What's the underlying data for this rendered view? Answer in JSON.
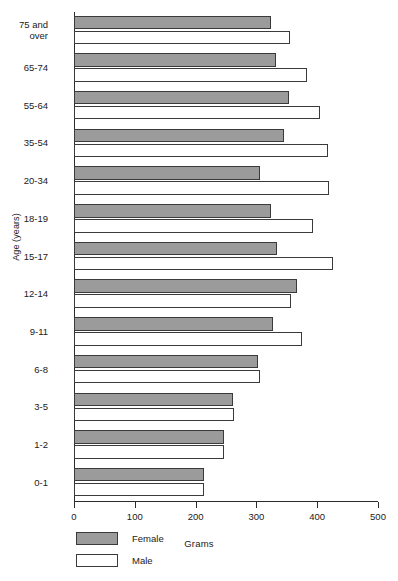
{
  "chart_data": {
    "type": "bar",
    "orientation": "horizontal",
    "title": "",
    "xlabel": "Grams",
    "ylabel": "Age (years)",
    "xlim": [
      0,
      500
    ],
    "xticks": [
      0,
      100,
      200,
      300,
      400,
      500
    ],
    "xtick_labels": [
      "0",
      "100",
      "200",
      "300",
      "400",
      "500"
    ],
    "grid": false,
    "legend_position": "bottom-left",
    "categories": [
      "75 and\nover",
      "65-74",
      "55-64",
      "35-54",
      "20-34",
      "18-19",
      "15-17",
      "12-14",
      "9-11",
      "6-8",
      "3-5",
      "1-2",
      "0-1"
    ],
    "series": [
      {
        "name": "Female",
        "color": "#9b9b9b",
        "values": [
          324,
          332,
          354,
          345,
          306,
          324,
          334,
          367,
          327,
          303,
          262,
          247,
          214
        ]
      },
      {
        "name": "Male",
        "color": "#ffffff",
        "values": [
          355,
          383,
          405,
          418,
          419,
          393,
          426,
          357,
          375,
          306,
          263,
          247,
          214
        ]
      }
    ]
  },
  "legend": {
    "items": [
      {
        "label": "Female",
        "swatch": "female"
      },
      {
        "label": "Male",
        "swatch": "male"
      }
    ]
  }
}
